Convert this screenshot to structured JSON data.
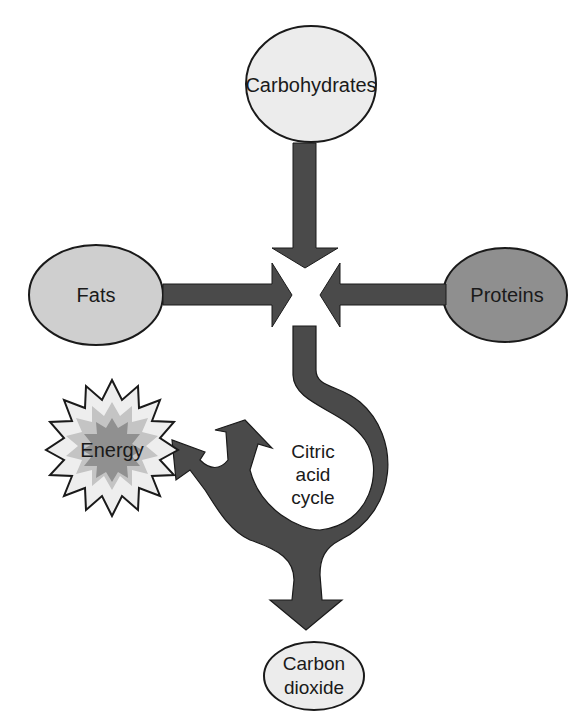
{
  "header_fragment": "",
  "nodes": {
    "carbohydrates": {
      "label": "Carbohydrates",
      "fill": "#ececec"
    },
    "fats": {
      "label": "Fats",
      "fill": "#cfcfcf"
    },
    "proteins": {
      "label": "Proteins",
      "fill": "#8f8f8f"
    },
    "energy": {
      "label": "Energy"
    },
    "cycle": {
      "line1": "Citric",
      "line2": "acid",
      "line3": "cycle"
    },
    "co2": {
      "line1": "Carbon",
      "line2": "dioxide",
      "fill": "#ececec"
    }
  },
  "colors": {
    "arrow": "#4a4a4a",
    "stroke": "#1a1a1a",
    "energy_outer": "#eeeeee",
    "energy_mid": "#c4c4c4",
    "energy_inner": "#a6a6a6",
    "energy_core": "#8c8c8c"
  }
}
